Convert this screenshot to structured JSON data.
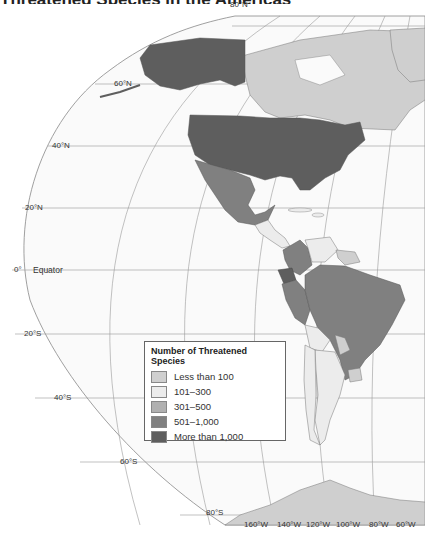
{
  "title": "Threatened Species in the Americas",
  "map": {
    "latitude_labels": [
      {
        "id": "lat-80n",
        "text": "80°N"
      },
      {
        "id": "lat-60n",
        "text": "60°N"
      },
      {
        "id": "lat-40n",
        "text": "40°N"
      },
      {
        "id": "lat-20n",
        "text": "20°N"
      },
      {
        "id": "lat-0",
        "text": "0°"
      },
      {
        "id": "lat-20s",
        "text": "20°S"
      },
      {
        "id": "lat-40s",
        "text": "40°S"
      },
      {
        "id": "lat-60s",
        "text": "60°S"
      },
      {
        "id": "lat-80s",
        "text": "80°S"
      }
    ],
    "equator_label": "Equator",
    "longitude_labels": [
      "160°W",
      "140°W",
      "120°W",
      "100°W",
      "80°W",
      "60°W"
    ]
  },
  "legend": {
    "title": "Number of Threatened Species",
    "items": [
      {
        "label": "Less than 100",
        "color": "#cfcfcf"
      },
      {
        "label": "101–300",
        "color": "#ececec"
      },
      {
        "label": "301–500",
        "color": "#b0b0b0"
      },
      {
        "label": "501–1,000",
        "color": "#808080"
      },
      {
        "label": "More than 1,000",
        "color": "#5e5e5e"
      }
    ]
  },
  "regions": [
    {
      "name": "Canada",
      "category": "Less than 100"
    },
    {
      "name": "Greenland",
      "category": "Less than 100"
    },
    {
      "name": "Alaska / United States",
      "category": "More than 1,000"
    },
    {
      "name": "Mexico",
      "category": "501–1,000"
    },
    {
      "name": "Central America",
      "category": "101–300"
    },
    {
      "name": "Colombia",
      "category": "501–1,000"
    },
    {
      "name": "Venezuela",
      "category": "101–300"
    },
    {
      "name": "Guianas",
      "category": "Less than 100"
    },
    {
      "name": "Ecuador",
      "category": "More than 1,000"
    },
    {
      "name": "Peru",
      "category": "501–1,000"
    },
    {
      "name": "Brazil",
      "category": "501–1,000"
    },
    {
      "name": "Bolivia",
      "category": "101–300"
    },
    {
      "name": "Paraguay",
      "category": "Less than 100"
    },
    {
      "name": "Uruguay",
      "category": "Less than 100"
    },
    {
      "name": "Argentina",
      "category": "101–300"
    },
    {
      "name": "Chile",
      "category": "101–300"
    },
    {
      "name": "Antarctica",
      "category": "Less than 100"
    }
  ]
}
